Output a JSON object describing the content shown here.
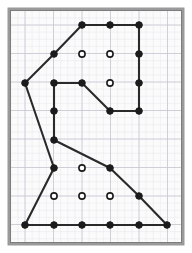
{
  "figure": {
    "type": "geoboard-lattice-polygon",
    "canvas": {
      "width": 192,
      "height": 253
    },
    "frame": {
      "x": 9,
      "y": 9,
      "width": 174,
      "height": 235,
      "outer_color": "#9a9a9a",
      "inner_color": "#7d7d7d",
      "fill_color": "#fbfbfb",
      "outer_stroke_width": 3,
      "inner_stroke_width": 1
    },
    "grid": {
      "origin_x": 25,
      "origin_y": 25,
      "spacing": 28.5,
      "minor_spacing": 7.125,
      "cols": 6,
      "rows": 8,
      "minor_color": "#e6e6ec",
      "major_color": "#c7c7d2",
      "minor_width": 0.5,
      "major_width": 0.8,
      "visible": true
    },
    "polygon": {
      "stroke_color": "#2a2a2a",
      "stroke_width": 2.1,
      "fill": "none",
      "closed": true,
      "vertices_lattice": [
        [
          2,
          0
        ],
        [
          3,
          0
        ],
        [
          4,
          0
        ],
        [
          4,
          3
        ],
        [
          3,
          3
        ],
        [
          2,
          2
        ],
        [
          1,
          2
        ],
        [
          1,
          4
        ],
        [
          3,
          5
        ],
        [
          4,
          6
        ],
        [
          5,
          7
        ],
        [
          4,
          7
        ],
        [
          3,
          7
        ],
        [
          2,
          7
        ],
        [
          1,
          7
        ],
        [
          0,
          7
        ],
        [
          1,
          5
        ],
        [
          0,
          2
        ],
        [
          1,
          1
        ]
      ],
      "vertices_px": [
        [
          82,
          25
        ],
        [
          110,
          25
        ],
        [
          139,
          25
        ],
        [
          139,
          111
        ],
        [
          110,
          111
        ],
        [
          82,
          83
        ],
        [
          54,
          83
        ],
        [
          54,
          140
        ],
        [
          110,
          168
        ],
        [
          139,
          196
        ],
        [
          167,
          225
        ],
        [
          139,
          225
        ],
        [
          110,
          225
        ],
        [
          82,
          225
        ],
        [
          54,
          225
        ],
        [
          25,
          225
        ],
        [
          54,
          168
        ],
        [
          25,
          83
        ],
        [
          54,
          54
        ]
      ]
    },
    "boundary_dots": {
      "label": "boundary-lattice-points",
      "style": "filled",
      "fill_color": "#1b1b1b",
      "stroke_color": "#1b1b1b",
      "radius": 3.3,
      "count": 19,
      "points_px": [
        [
          82,
          25
        ],
        [
          110,
          25
        ],
        [
          139,
          25
        ],
        [
          139,
          54
        ],
        [
          139,
          83
        ],
        [
          139,
          111
        ],
        [
          110,
          111
        ],
        [
          82,
          83
        ],
        [
          54,
          83
        ],
        [
          54,
          111
        ],
        [
          54,
          140
        ],
        [
          110,
          168
        ],
        [
          139,
          196
        ],
        [
          167,
          225
        ],
        [
          139,
          225
        ],
        [
          110,
          225
        ],
        [
          82,
          225
        ],
        [
          54,
          225
        ],
        [
          25,
          225
        ],
        [
          54,
          168
        ],
        [
          25,
          83
        ],
        [
          54,
          54
        ]
      ]
    },
    "interior_dots": {
      "label": "interior-lattice-points",
      "style": "hollow",
      "fill_color": "#ffffff",
      "stroke_color": "#1b1b1b",
      "radius": 3.1,
      "stroke_width": 1.6,
      "count": 7,
      "points_px": [
        [
          82,
          54
        ],
        [
          110,
          54
        ],
        [
          110,
          83
        ],
        [
          82,
          168
        ],
        [
          54,
          196
        ],
        [
          82,
          196
        ],
        [
          110,
          196
        ]
      ]
    }
  }
}
